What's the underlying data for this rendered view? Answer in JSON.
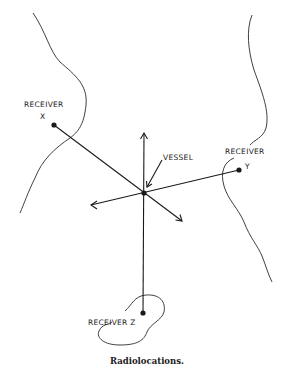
{
  "diagram": {
    "caption": "Radiolocations.",
    "vessel": {
      "label": "VESSEL",
      "x": 144,
      "y": 193
    },
    "receivers": [
      {
        "id": "x",
        "label": "RECEIVER",
        "letter": "X",
        "x": 54,
        "y": 125
      },
      {
        "id": "y",
        "label": "RECEIVER",
        "letter": "Y",
        "x": 239,
        "y": 170
      },
      {
        "id": "z",
        "label": "RECEIVER Z",
        "x": 143,
        "y": 313
      }
    ],
    "arrows": [
      {
        "direction": "up",
        "tip_x": 144,
        "tip_y": 133
      },
      {
        "direction": "left",
        "tip_x": 91,
        "tip_y": 205
      },
      {
        "direction": "down-right",
        "tip_x": 182,
        "tip_y": 221
      }
    ],
    "colors": {
      "ink": "#1a1a1a",
      "background": "#ffffff"
    }
  }
}
